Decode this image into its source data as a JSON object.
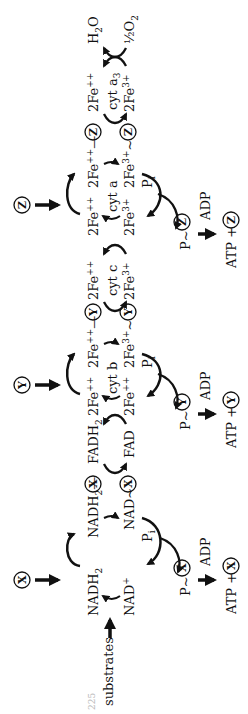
{
  "figure": {
    "orientation": "rotated 90 degrees counter-clockwise",
    "page_number_partial": "225",
    "input": {
      "label": "substrates"
    },
    "carriers": [
      {
        "name": "X",
        "reduced": "NADH2",
        "oxidized": "NAD+",
        "complex_reduced": "NADH2—X",
        "complex_oxidized": "NAD~X"
      },
      {
        "name": "FAD",
        "reduced": "FADH2",
        "oxidized": "FAD"
      },
      {
        "name": "Y",
        "cytochrome": "cyt b",
        "reduced": "2Fe++",
        "oxidized": "2Fe3+",
        "complex_reduced": "2Fe++—Y",
        "complex_oxidized": "2Fe3+~Y"
      },
      {
        "name": "cyt c",
        "cytochrome": "cyt c",
        "reduced": "2Fe++",
        "oxidized": "2Fe3+"
      },
      {
        "name": "Z",
        "cytochrome": "cyt a",
        "reduced": "2Fe++",
        "oxidized": "2Fe3+",
        "complex_reduced": "2Fe++—Z",
        "complex_oxidized": "2Fe3+~Z"
      },
      {
        "name": "cyt a3",
        "cytochrome": "cyt a3",
        "reduced": "2Fe++",
        "oxidized": "2Fe3+"
      }
    ],
    "terminal": {
      "reduced": "H2O",
      "oxidized": "½O2"
    },
    "phosphorylation_sites": [
      {
        "factor": "X",
        "pi": "Pi",
        "intermediate": "P~X",
        "adp": "ADP",
        "product": "ATP + X"
      },
      {
        "factor": "Y",
        "pi": "Pi",
        "intermediate": "P~Y",
        "adp": "ADP",
        "product": "ATP + Y"
      },
      {
        "factor": "Z",
        "pi": "Pi",
        "intermediate": "P~Z",
        "adp": "ADP",
        "product": "ATP + Z"
      }
    ]
  },
  "labels": {
    "substrates": "substrates",
    "nadh2": "NADH",
    "nad": "NAD",
    "plus": "+",
    "fadh2": "FADH",
    "fad": "FAD",
    "sub2": "2",
    "fe2": "2Fe",
    "pp": "++",
    "fe3": "2Fe",
    "sup3p": "3+",
    "cyt_b": "cyt b",
    "cyt_c": "cyt c",
    "cyt_a": "cyt a",
    "cyt_a3_base": "cyt a",
    "cyt_a3_sub": "3",
    "h2o_h": "H",
    "h2o_o": "O",
    "half_o2": "½O",
    "pi_p": "P",
    "pi_i": "i",
    "p_tilde": "P",
    "adp": "ADP",
    "atp_plus": "ATP +",
    "X": "X",
    "Y": "Y",
    "Z": "Z",
    "dash": "—",
    "tilde": "~",
    "page_num": "225"
  }
}
